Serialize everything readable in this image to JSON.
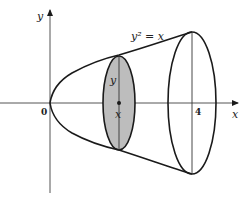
{
  "figure": {
    "axes": {
      "x_label": "x",
      "y_label": "y",
      "origin_label": "0",
      "tick_label_x": "4"
    },
    "curve_label": "y² = x",
    "slice": {
      "radius_label": "y",
      "position_label": "x",
      "fill_color": "#bdbdbd"
    },
    "colors": {
      "stroke": "#1a1a1a",
      "background": "#ffffff"
    }
  }
}
